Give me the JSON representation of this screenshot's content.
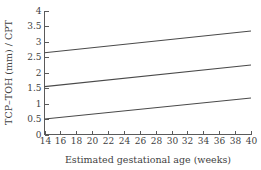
{
  "chart_data": {
    "type": "line",
    "title": "",
    "subtitle": "",
    "xlabel": "Estimated gestational age (weeks)",
    "ylabel": "TCP–TOH (mm) / CPT",
    "xlim": [
      14,
      40
    ],
    "ylim": [
      0,
      4
    ],
    "xticks": [
      14,
      16,
      18,
      20,
      22,
      24,
      26,
      28,
      30,
      32,
      34,
      36,
      38,
      40
    ],
    "yticks": [
      0,
      0.5,
      1,
      1.5,
      2,
      2.5,
      3,
      3.5,
      4
    ],
    "xtick_labels": [
      "14",
      "16",
      "18",
      "20",
      "22",
      "24",
      "26",
      "28",
      "30",
      "32",
      "34",
      "36",
      "38",
      "40"
    ],
    "ytick_labels": [
      "0",
      "0.5",
      "1",
      "1.5",
      "2",
      "2.5",
      "3",
      "3.5",
      "4"
    ],
    "grid": false,
    "legend": false,
    "legend_position": "none",
    "x": [
      14,
      40
    ],
    "series": [
      {
        "name": "upper-centile",
        "values": [
          2.65,
          3.35
        ],
        "color": "#4a4a4a"
      },
      {
        "name": "median-centile",
        "values": [
          1.55,
          2.25
        ],
        "color": "#4a4a4a"
      },
      {
        "name": "lower-centile",
        "values": [
          0.5,
          1.18
        ],
        "color": "#4a4a4a"
      }
    ],
    "annotations": []
  },
  "figure": {
    "background_color": "#ffffff",
    "axis_color": "#5a5a5a",
    "text_color": "#3f3f3f"
  }
}
